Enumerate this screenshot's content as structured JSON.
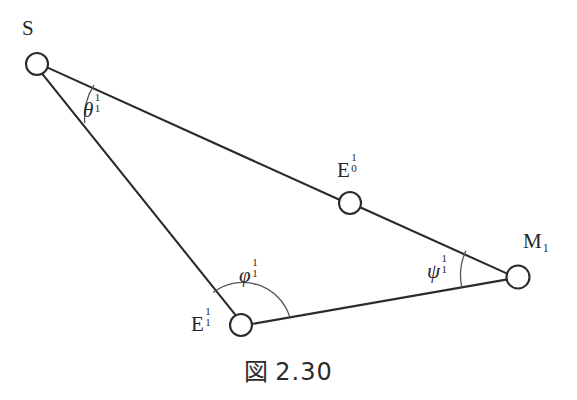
{
  "figure": {
    "caption_mark": "図",
    "caption_number": "2.30",
    "background_color": "#ffffff",
    "stroke_color": "#2b2b2b",
    "arc_color": "#4a4a4a",
    "node_radius": 11,
    "nodes": [
      {
        "id": "S",
        "label_base": "S",
        "sup": "",
        "sub": "",
        "cx": 37,
        "cy": 64,
        "label_x": 22,
        "label_y": 18
      },
      {
        "id": "E0",
        "label_base": "E",
        "sup": "1",
        "sub": "0",
        "cx": 350,
        "cy": 203,
        "label_x": 337,
        "label_y": 157
      },
      {
        "id": "M1",
        "label_base": "M",
        "sup": "",
        "sub": "1",
        "cx": 518,
        "cy": 277,
        "label_x": 523,
        "label_y": 231
      },
      {
        "id": "E1",
        "label_base": "E",
        "sup": "1",
        "sub": "1",
        "cx": 241,
        "cy": 325,
        "label_x": 191,
        "label_y": 311
      }
    ],
    "edges": [
      {
        "from": "S",
        "to": "E0"
      },
      {
        "from": "E0",
        "to": "M1"
      },
      {
        "from": "M1",
        "to": "E1"
      },
      {
        "from": "E1",
        "to": "S"
      }
    ],
    "angles": [
      {
        "id": "theta",
        "glyph": "θ",
        "sup": "1",
        "sub": "1",
        "at": "S",
        "label_x": 83,
        "label_y": 97
      },
      {
        "id": "psi",
        "glyph": "ψ",
        "sup": "1",
        "sub": "1",
        "at": "M1",
        "label_x": 427,
        "label_y": 258
      },
      {
        "id": "phi",
        "glyph": "φ",
        "sup": "1",
        "sub": "1",
        "at": "E1",
        "label_x": 239,
        "label_y": 262
      }
    ]
  }
}
